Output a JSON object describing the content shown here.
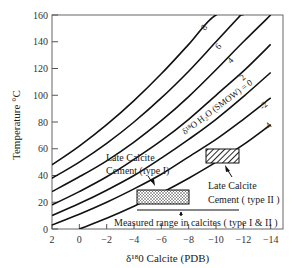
{
  "chart_data": {
    "type": "line",
    "title": "",
    "xlabel": "δ18O Calcite (PDB)",
    "ylabel": "Temperature °C",
    "xlim": [
      2,
      -15
    ],
    "ylim": [
      0,
      160
    ],
    "x_ticks": [
      2,
      0,
      -2,
      -4,
      -6,
      -8,
      -10,
      -12,
      -14
    ],
    "y_ticks": [
      0,
      20,
      40,
      60,
      80,
      100,
      120,
      140,
      160
    ],
    "x_tick_labels": [
      "2",
      "0",
      "−2",
      "−4",
      "−6",
      "−8",
      "−10",
      "−12",
      "−14"
    ],
    "y_tick_labels": [
      "0",
      "20",
      "40",
      "60",
      "80",
      "100",
      "120",
      "140",
      "160"
    ],
    "grid": false,
    "series_label_prefix": "δ18O H2O (SMOW)",
    "series": [
      {
        "name": "8",
        "x": [
          2,
          0,
          -2,
          -4,
          -6,
          -8,
          -10,
          -12
        ],
        "y": [
          48,
          62,
          78,
          96,
          116,
          138,
          160,
          160
        ]
      },
      {
        "name": "6",
        "x": [
          2,
          0,
          -2,
          -4,
          -6,
          -8,
          -10,
          -12,
          -13
        ],
        "y": [
          38,
          50,
          64,
          80,
          98,
          118,
          140,
          162,
          172
        ]
      },
      {
        "name": "4",
        "x": [
          2,
          0,
          -2,
          -4,
          -6,
          -8,
          -10,
          -12,
          -14
        ],
        "y": [
          28,
          39,
          51,
          65,
          81,
          99,
          119,
          140,
          160
        ]
      },
      {
        "name": "2",
        "x": [
          2,
          0,
          -2,
          -4,
          -6,
          -8,
          -10,
          -12,
          -14
        ],
        "y": [
          18,
          28,
          39,
          52,
          66,
          82,
          100,
          118,
          138
        ]
      },
      {
        "name": "0",
        "x": [
          2,
          0,
          -2,
          -4,
          -6,
          -8,
          -10,
          -12,
          -14
        ],
        "y": [
          10,
          19,
          29,
          40,
          53,
          67,
          82,
          99,
          117
        ]
      },
      {
        "name": "-2",
        "x": [
          2,
          0,
          -2,
          -4,
          -6,
          -8,
          -10,
          -12,
          -14
        ],
        "y": [
          3,
          11,
          20,
          30,
          41,
          54,
          67,
          82,
          98
        ]
      },
      {
        "name": "-4",
        "x": [
          0,
          -2,
          -4,
          -6,
          -8,
          -10,
          -12,
          -14
        ],
        "y": [
          0,
          8,
          17,
          27,
          38,
          50,
          63,
          78
        ]
      }
    ],
    "boxes": [
      {
        "name": "Late Calcite Cement (type I)",
        "x_range": [
          -4.5,
          -8.5
        ],
        "y_range": [
          22,
          32
        ],
        "pattern": "stipple"
      },
      {
        "name": "Late Calcite Cement (type II)",
        "x_range": [
          -9.7,
          -12.2
        ],
        "y_range": [
          52,
          61
        ],
        "pattern": "hatch"
      }
    ],
    "measured_range": {
      "label": "Measured range in calcites ( type I & II )",
      "x_range": [
        -4.5,
        -12.2
      ],
      "y": 17
    }
  },
  "labels": {
    "curve_8": "8",
    "curve_6": "6",
    "curve_4": "4",
    "curve_2": "2",
    "curve_0": "δ¹⁸O H₂O (SMOW) = 0",
    "curve_m2": "-2",
    "curve_m4": "-4",
    "type1_line1": "Late Calcite",
    "type1_line2": "Cement (type I)",
    "type2_line1": "Late Calcite",
    "type2_line2": "Cement ( type II )",
    "measured": "Measured range in calcites ( type I & II )",
    "xlabel": "δ¹⁸0 Calcite (PDB)",
    "ylabel": "Temperature °C"
  },
  "colors": {
    "line": "#111111",
    "axis": "#555555",
    "text": "#222222"
  }
}
